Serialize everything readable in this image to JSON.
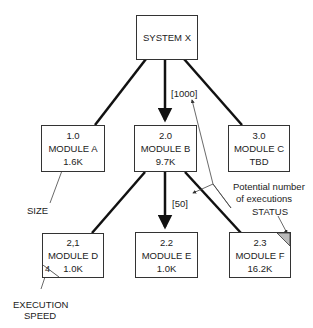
{
  "diagram": {
    "root": {
      "name": "SYSTEM X"
    },
    "modules": [
      {
        "id": "1.0",
        "name": "MODULE A",
        "size": "1.6K"
      },
      {
        "id": "2.0",
        "name": "MODULE B",
        "size": "9.7K"
      },
      {
        "id": "3.0",
        "name": "MODULE C",
        "size": "TBD"
      },
      {
        "id": "2,1",
        "name": "MODULE D",
        "size": "1.0K",
        "execution_speed": "4"
      },
      {
        "id": "2.2",
        "name": "MODULE E",
        "size": "1.0K"
      },
      {
        "id": "2.3",
        "name": "MODULE F",
        "size": "16.2K",
        "status": "shaded"
      }
    ],
    "edge_labels": {
      "system_to_b": "[1000]",
      "b_to_e": "[50]"
    },
    "annotations": {
      "size": "SIZE",
      "potential_line1": "Potential number",
      "potential_line2": "of executions",
      "status": "STATUS",
      "exec_line1": "EXECUTION",
      "exec_line2": "SPEED"
    }
  }
}
